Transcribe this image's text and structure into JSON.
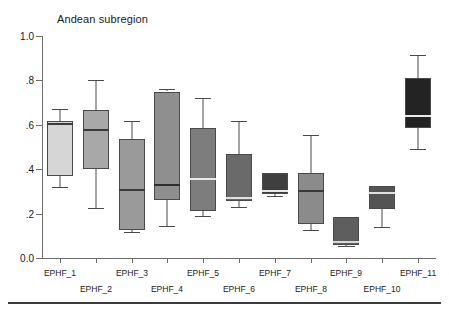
{
  "chart_data": {
    "type": "box",
    "title": "Andean subregion",
    "xlabel": "",
    "ylabel": "",
    "ylim": [
      0.0,
      1.0
    ],
    "grid": false,
    "legend": "none",
    "ytick_labels": [
      "0.0",
      ".2",
      ".4",
      ".6",
      ".8",
      "1.0"
    ],
    "ytick_values": [
      0.0,
      0.2,
      0.4,
      0.6,
      0.8,
      1.0
    ],
    "categories": [
      "EPHF_1",
      "EPHF_2",
      "EPHF_3",
      "EPHF_4",
      "EPHF_5",
      "EPHF_6",
      "EPHF_7",
      "EPHF_8",
      "EPHF_9",
      "EPHF_10",
      "EPHF_11"
    ],
    "boxes": [
      {
        "label": "EPHF_1",
        "whisker_low": 0.32,
        "q1": 0.37,
        "median": 0.605,
        "q3": 0.615,
        "whisker_high": 0.67,
        "color": "#d6d6d6",
        "median_color": "#3a3a3a"
      },
      {
        "label": "EPHF_2",
        "whisker_low": 0.225,
        "q1": 0.4,
        "median": 0.575,
        "q3": 0.665,
        "whisker_high": 0.8,
        "color": "#a8a8a8",
        "median_color": "#3a3a3a"
      },
      {
        "label": "EPHF_3",
        "whisker_low": 0.115,
        "q1": 0.125,
        "median": 0.305,
        "q3": 0.535,
        "whisker_high": 0.615,
        "color": "#9a9a9a",
        "median_color": "#3a3a3a"
      },
      {
        "label": "EPHF_4",
        "whisker_low": 0.145,
        "q1": 0.26,
        "median": 0.33,
        "q3": 0.75,
        "whisker_high": 0.76,
        "color": "#8f8f8f",
        "median_color": "#2e2e2e"
      },
      {
        "label": "EPHF_5",
        "whisker_low": 0.19,
        "q1": 0.21,
        "median": 0.355,
        "q3": 0.585,
        "whisker_high": 0.72,
        "color": "#7d7d7d",
        "median_color": "#e8e8e8"
      },
      {
        "label": "EPHF_6",
        "whisker_low": 0.23,
        "q1": 0.255,
        "median": 0.27,
        "q3": 0.47,
        "whisker_high": 0.615,
        "color": "#6a6a6a",
        "median_color": "#e0e0e0"
      },
      {
        "label": "EPHF_7",
        "whisker_low": 0.28,
        "q1": 0.29,
        "median": 0.3,
        "q3": 0.385,
        "whisker_high": 0.385,
        "color": "#3f3f3f",
        "median_color": "#e8e8e8"
      },
      {
        "label": "EPHF_8",
        "whisker_low": 0.125,
        "q1": 0.155,
        "median": 0.3,
        "q3": 0.385,
        "whisker_high": 0.555,
        "color": "#8b8b8b",
        "median_color": "#3a3a3a"
      },
      {
        "label": "EPHF_9",
        "whisker_low": 0.055,
        "q1": 0.06,
        "median": 0.07,
        "q3": 0.185,
        "whisker_high": 0.185,
        "color": "#5e5e5e",
        "median_color": "#d8d8d8"
      },
      {
        "label": "EPHF_10",
        "whisker_low": 0.14,
        "q1": 0.22,
        "median": 0.295,
        "q3": 0.325,
        "whisker_high": 0.325,
        "color": "#545454",
        "median_color": "#e0e0e0"
      },
      {
        "label": "EPHF_11",
        "whisker_low": 0.49,
        "q1": 0.585,
        "median": 0.64,
        "q3": 0.81,
        "whisker_high": 0.915,
        "color": "#232323",
        "median_color": "#e8e8e8"
      }
    ]
  },
  "axis": {
    "line_color": "#6e6e6e"
  }
}
